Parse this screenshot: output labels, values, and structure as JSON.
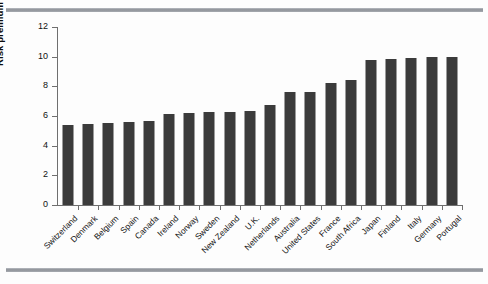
{
  "decor": {
    "top_rule_color": "#8d9197",
    "bottom_rule_color": "#8d9197"
  },
  "chart_data": {
    "type": "bar",
    "title": "",
    "xlabel": "",
    "ylabel": "Risk premium (%)",
    "ylim": [
      0,
      12
    ],
    "yticks": [
      0,
      2,
      4,
      6,
      8,
      10,
      12
    ],
    "ytick_labels": [
      "0",
      "2",
      "4",
      "6",
      "8",
      "10",
      "12"
    ],
    "grid": false,
    "legend": null,
    "bar_color": "#3b3b3b",
    "categories": [
      "Switzerland",
      "Denmark",
      "Belgium",
      "Spain",
      "Canada",
      "Ireland",
      "Norway",
      "Sweden",
      "New Zealand",
      "U.K.",
      "Netherlands",
      "Australia",
      "United States",
      "France",
      "South Africa",
      "Japan",
      "Finland",
      "Italy",
      "Germany",
      "Portugal"
    ],
    "values": [
      5.4,
      5.45,
      5.5,
      5.6,
      5.65,
      6.15,
      6.2,
      6.25,
      6.3,
      6.35,
      6.75,
      7.6,
      7.6,
      8.25,
      8.45,
      9.75,
      9.85,
      9.9,
      9.95,
      9.95
    ]
  }
}
